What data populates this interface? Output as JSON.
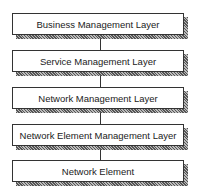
{
  "diagram": {
    "layers": [
      {
        "label": "Business Management Layer"
      },
      {
        "label": "Service Management Layer"
      },
      {
        "label": "Network Management Layer"
      },
      {
        "label": "Network Element Management Layer"
      },
      {
        "label": "Network Element"
      }
    ]
  }
}
